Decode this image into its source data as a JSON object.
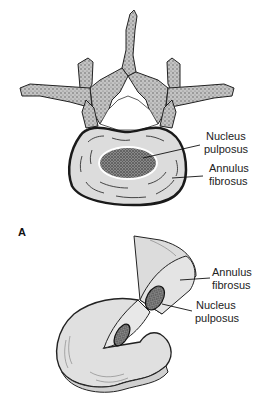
{
  "figure": {
    "panel_label": "A",
    "top_view": {
      "subject": "vertebra-with-intervertebral-disc-superior-view",
      "labels": [
        {
          "line1": "Nucleus",
          "line2": "pulposus"
        },
        {
          "line1": "Annulus",
          "line2": "fibrosus"
        }
      ]
    },
    "cutaway_view": {
      "subject": "intervertebral-disc-cutaway",
      "labels": [
        {
          "line1": "Annulus",
          "line2": "fibrosus"
        },
        {
          "line1": "Nucleus",
          "line2": "pulposus"
        }
      ]
    },
    "colors": {
      "background": "#ffffff",
      "bone": "#a8a8a8",
      "disc": "#dcdcdc",
      "nucleus": "#6e6e6e",
      "outline": "#222222"
    }
  }
}
